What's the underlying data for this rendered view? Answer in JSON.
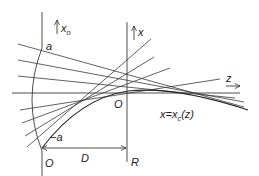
{
  "diagram": {
    "labels": {
      "a_top": "a",
      "a_bottom": "−a",
      "origin_left": "O",
      "origin_right": "O",
      "distance": "D",
      "radius": "R",
      "axis_x": "x",
      "axis_x0": "x",
      "axis_x0_sub": "o",
      "axis_z": "z",
      "curve_label_prefix": "x=x",
      "curve_label_sub": "c",
      "curve_label_suffix": "(z)"
    },
    "elements": [
      "initial-plane-axis",
      "lens-plane-axis",
      "optical-z-axis",
      "curved-wavefront-arc",
      "rays",
      "caustic-curve",
      "distance-arrow"
    ]
  }
}
